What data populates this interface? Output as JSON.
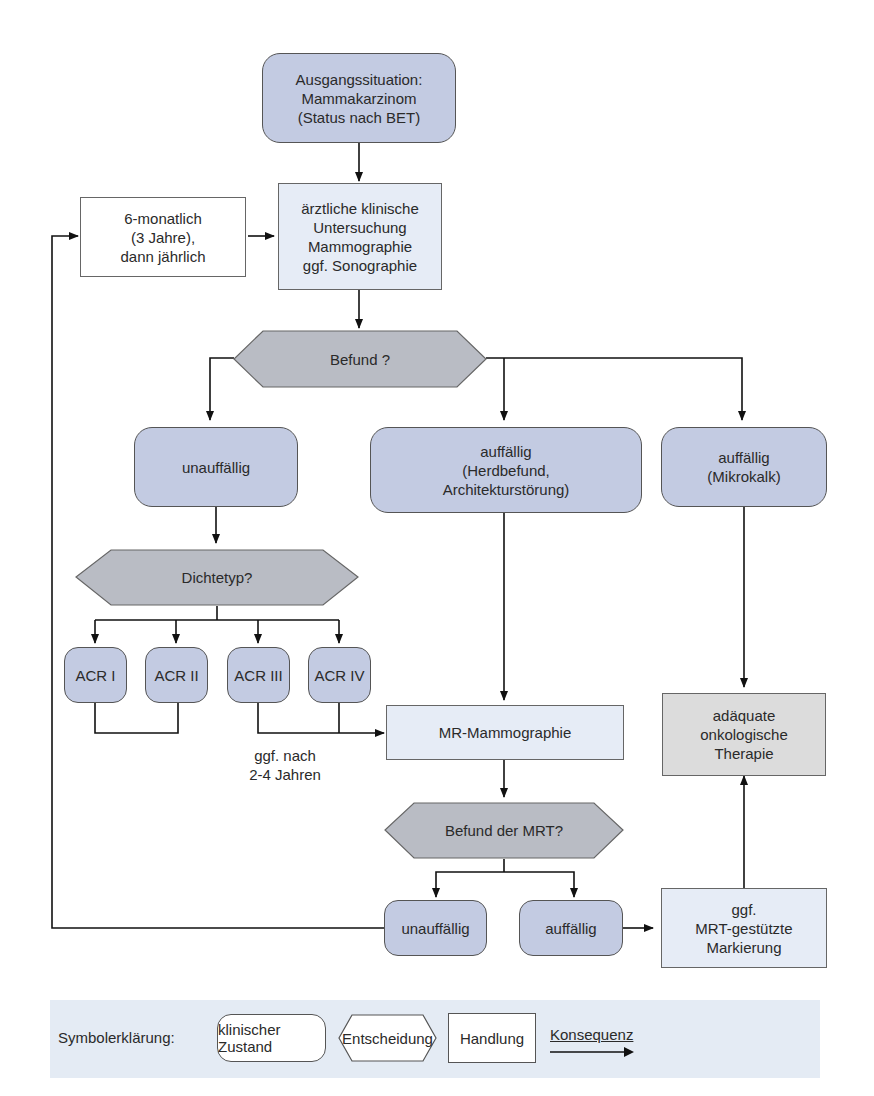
{
  "diagram": {
    "nodes": {
      "start": "Ausgangssituation:\nMammakarzinom\n(Status nach BET)",
      "interval": "6-monatlich\n(3 Jahre),\ndann jährlich",
      "exam": "ärztliche klinische\nUntersuchung\nMammographie\nggf. Sonographie",
      "befund": "Befund ?",
      "unauffaellig": "unauffällig",
      "herdbefund": "auffällig\n(Herdbefund,\nArchitekturstörung)",
      "mikrokalk": "auffällig\n(Mikrokalk)",
      "dichtetyp": "Dichtetyp?",
      "acr1": "ACR I",
      "acr2": "ACR II",
      "acr3": "ACR III",
      "acr4": "ACR IV",
      "mr": "MR-Mammographie",
      "therapie": "adäquate\nonkologische\nTherapie",
      "befund_mrt": "Befund der MRT?",
      "mrt_unauffaellig": "unauffällig",
      "mrt_auffaellig": "auffällig",
      "markierung": "ggf.\nMRT-gestützte\nMarkierung"
    },
    "annotations": {
      "acr_note": "ggf. nach\n2-4 Jahren"
    }
  },
  "legend": {
    "title": "Symbolerklärung:",
    "state": "klinischer Zustand",
    "decision": "Entscheidung",
    "action": "Handlung",
    "consequence": "Konsequenz"
  },
  "colors": {
    "state_fill": "#c3cbe2",
    "decision_fill": "#b9bcc4",
    "action_fill": "#e6ecf6",
    "therapy_fill": "#dcdcdc",
    "legend_bg": "#e4ebf4"
  }
}
